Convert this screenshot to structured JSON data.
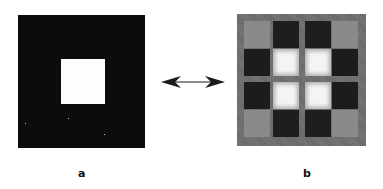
{
  "figure": {
    "panels": [
      {
        "id": "a",
        "label": "a",
        "description": "Black square image with centered white square",
        "background": "#0c0c0c",
        "foreground": "#fdfdfd"
      },
      {
        "id": "b",
        "label": "b",
        "description": "Transform of panel a rendered as 4x4 grayscale block grid",
        "background": "#6e6e6e",
        "grid": [
          [
            "#8a8a8a",
            "#1e1e1e",
            "#1e1e1e",
            "#8a8a8a"
          ],
          [
            "#1c1c1c",
            "#f4f4f4",
            "#f4f4f4",
            "#1c1c1c"
          ],
          [
            "#1c1c1c",
            "#f4f4f4",
            "#f4f4f4",
            "#1c1c1c"
          ],
          [
            "#8a8a8a",
            "#1e1e1e",
            "#1e1e1e",
            "#8a8a8a"
          ]
        ]
      }
    ],
    "connector": {
      "type": "double-headed-arrow",
      "color": "#1a1a1a"
    }
  }
}
